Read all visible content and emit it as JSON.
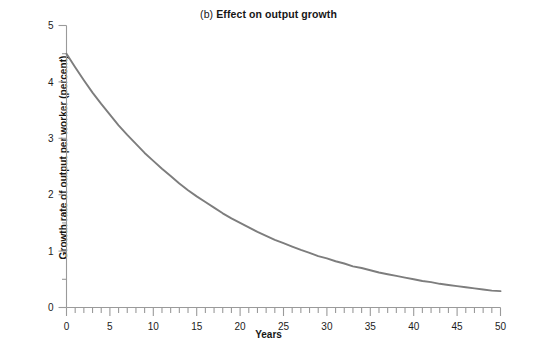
{
  "chart_data": {
    "type": "line",
    "title": "(b) Effect on output growth",
    "title_prefix": "(b)",
    "title_main": "Effect on output growth",
    "xlabel": "Years",
    "ylabel": "Growth rate of output per worker (percent)",
    "xlim": [
      0,
      50
    ],
    "ylim": [
      0,
      5
    ],
    "xticks": [
      0,
      5,
      10,
      15,
      20,
      25,
      30,
      35,
      40,
      45,
      50
    ],
    "xtick_labels": [
      "0",
      "5",
      "10",
      "15",
      "20",
      "25",
      "30",
      "35",
      "40",
      "45",
      "50"
    ],
    "x_minor_tick_step": 1,
    "yticks": [
      0,
      1,
      2,
      3,
      4,
      5
    ],
    "ytick_labels": [
      "0",
      "1",
      "2",
      "3",
      "4",
      "5"
    ],
    "y_minor_tick_step": 0.5,
    "grid": false,
    "legend": null,
    "line_color": "#7d7d7d",
    "line_width": 1.9,
    "axis_color": "#9a9a9a",
    "series": [
      {
        "name": "Growth rate of output per worker",
        "x": [
          0,
          1,
          2,
          3,
          4,
          5,
          6,
          7,
          8,
          9,
          10,
          11,
          12,
          13,
          14,
          15,
          16,
          17,
          18,
          19,
          20,
          21,
          22,
          23,
          24,
          25,
          26,
          27,
          28,
          29,
          30,
          31,
          32,
          33,
          34,
          35,
          36,
          37,
          38,
          39,
          40,
          41,
          42,
          43,
          44,
          45,
          46,
          47,
          48,
          49,
          50
        ],
        "values": [
          4.5,
          4.26,
          4.03,
          3.81,
          3.61,
          3.42,
          3.23,
          3.06,
          2.9,
          2.74,
          2.6,
          2.46,
          2.33,
          2.2,
          2.08,
          1.97,
          1.87,
          1.77,
          1.67,
          1.58,
          1.5,
          1.42,
          1.34,
          1.27,
          1.2,
          1.14,
          1.08,
          1.02,
          0.97,
          0.91,
          0.87,
          0.82,
          0.78,
          0.73,
          0.7,
          0.66,
          0.62,
          0.59,
          0.56,
          0.53,
          0.5,
          0.47,
          0.45,
          0.42,
          0.4,
          0.38,
          0.36,
          0.34,
          0.32,
          0.3,
          0.29
        ]
      }
    ]
  }
}
